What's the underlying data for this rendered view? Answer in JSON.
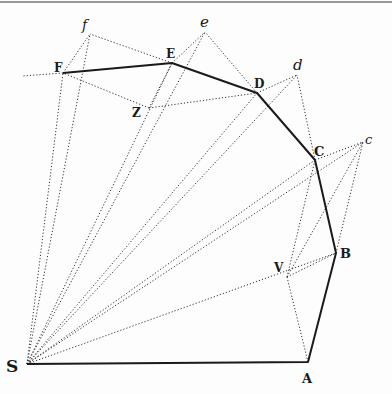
{
  "diagram": {
    "top_rule_color": "#777777",
    "ink_color": "#1a1a1a",
    "points": {
      "S": [
        27,
        364
      ],
      "A": [
        308,
        362
      ],
      "B": [
        336,
        253
      ],
      "C": [
        315,
        160
      ],
      "D": [
        257,
        93
      ],
      "E": [
        172,
        63
      ],
      "F": [
        63,
        73
      ],
      "Z": [
        149,
        108
      ],
      "V": [
        287,
        277
      ],
      "c": [
        363,
        142
      ],
      "d": [
        297,
        75
      ],
      "e": [
        205,
        32
      ],
      "f": [
        90,
        34
      ]
    },
    "labels": {
      "S": "S",
      "A": "A",
      "B": "B",
      "C": "C",
      "D": "D",
      "E": "E",
      "F": "F",
      "Z": "Z",
      "V": "V",
      "c": "c",
      "d": "d",
      "e": "e",
      "f": "f"
    },
    "solid_path": [
      "S",
      "A",
      "B",
      "C",
      "D",
      "E",
      "F"
    ],
    "dotted_segments": [
      [
        "S",
        "B"
      ],
      [
        "S",
        "C"
      ],
      [
        "S",
        "c"
      ],
      [
        "S",
        "D"
      ],
      [
        "S",
        "d"
      ],
      [
        "S",
        "E"
      ],
      [
        "S",
        "e"
      ],
      [
        "S",
        "F"
      ],
      [
        "S",
        "f"
      ],
      [
        "B",
        "c"
      ],
      [
        "C",
        "c"
      ],
      [
        "c",
        "V"
      ],
      [
        "V",
        "A"
      ],
      [
        "V",
        "B"
      ],
      [
        "V",
        "C"
      ],
      [
        "C",
        "d"
      ],
      [
        "D",
        "d"
      ],
      [
        "D",
        "e"
      ],
      [
        "E",
        "e"
      ],
      [
        "E",
        "f"
      ],
      [
        "F",
        "f"
      ],
      [
        "Z",
        "D"
      ],
      [
        "Z",
        "F"
      ],
      [
        "Z",
        "E"
      ],
      [
        "F",
        "X0"
      ]
    ]
  }
}
